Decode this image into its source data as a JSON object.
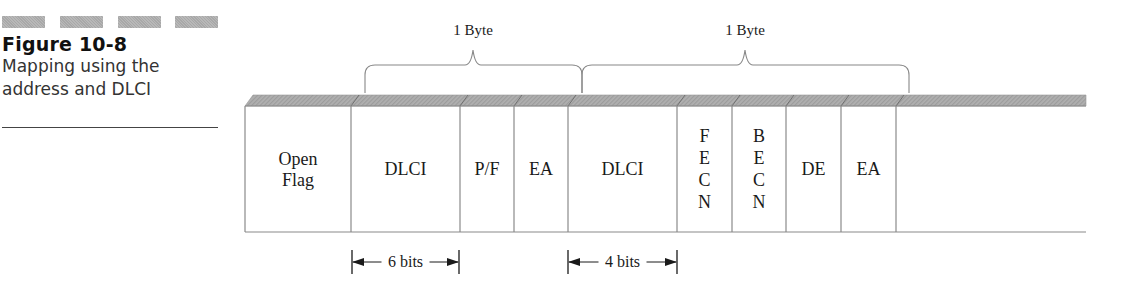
{
  "figure": {
    "number_label": "Figure 10-8",
    "caption_line1": "Mapping using the",
    "caption_line2": "address and DLCI"
  },
  "diagram": {
    "frame_fields": [
      {
        "id": "open-flag",
        "lines": [
          "Open",
          "Flag"
        ],
        "x": 245,
        "w": 106
      },
      {
        "id": "dlci-1",
        "lines": [
          "DLCI"
        ],
        "x": 351,
        "w": 109
      },
      {
        "id": "pf",
        "lines": [
          "P/F"
        ],
        "x": 460,
        "w": 54
      },
      {
        "id": "ea-1",
        "lines": [
          "EA"
        ],
        "x": 514,
        "w": 54
      },
      {
        "id": "dlci-2",
        "lines": [
          "DLCI"
        ],
        "x": 568,
        "w": 109
      },
      {
        "id": "fecn",
        "lines": [
          "F",
          "E",
          "C",
          "N"
        ],
        "x": 677,
        "w": 55
      },
      {
        "id": "becn",
        "lines": [
          "B",
          "E",
          "C",
          "N"
        ],
        "x": 732,
        "w": 54
      },
      {
        "id": "de",
        "lines": [
          "DE"
        ],
        "x": 786,
        "w": 55
      },
      {
        "id": "ea-2",
        "lines": [
          "EA"
        ],
        "x": 841,
        "w": 55
      },
      {
        "id": "remainder",
        "lines": [],
        "x": 896,
        "w": 190
      }
    ],
    "byte_braces": [
      {
        "label": "1 Byte",
        "x1": 365,
        "x2": 582,
        "apex": 473
      },
      {
        "label": "1 Byte",
        "x1": 582,
        "x2": 909,
        "apex": 745
      }
    ],
    "bit_spans": [
      {
        "label": "6 bits",
        "x1": 352,
        "x2": 459
      },
      {
        "label": "4 bits",
        "x1": 568,
        "x2": 677
      }
    ],
    "colors": {
      "band": "#a9a9a9",
      "border": "#8a8a8a",
      "text": "#1a1a1a"
    }
  }
}
